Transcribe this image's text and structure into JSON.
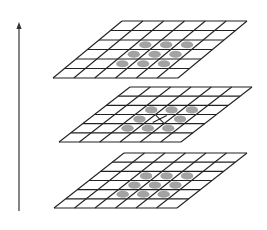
{
  "diagram": {
    "colors": {
      "line": "#222222",
      "dot": "#a3a3a3",
      "background": "#ffffff",
      "arrow": "#333333"
    },
    "grid": {
      "rows": 6,
      "cols": 6
    },
    "arrow": {
      "x": 19,
      "y_start": 211,
      "y_end": 22,
      "direction": "up"
    },
    "layers": [
      {
        "name": "top-layer",
        "corners": {
          "tl": [
            122,
            21
          ],
          "tr": [
            247,
            21
          ],
          "bl": [
            53,
            78
          ],
          "br": [
            177,
            78
          ]
        },
        "dots": [
          [
            2,
            2
          ],
          [
            2,
            3
          ],
          [
            2,
            4
          ],
          [
            3,
            2
          ],
          [
            3,
            3
          ],
          [
            3,
            4
          ],
          [
            4,
            2
          ],
          [
            4,
            3
          ],
          [
            4,
            4
          ]
        ],
        "mark": null
      },
      {
        "name": "middle-layer",
        "corners": {
          "tl": [
            130,
            87
          ],
          "tr": [
            252,
            87
          ],
          "bl": [
            59,
            142
          ],
          "br": [
            182,
            142
          ]
        },
        "dots": [
          [
            2,
            2
          ],
          [
            2,
            3
          ],
          [
            2,
            4
          ],
          [
            3,
            2
          ],
          [
            3,
            4
          ],
          [
            4,
            2
          ],
          [
            4,
            3
          ],
          [
            4,
            4
          ]
        ],
        "mark": {
          "type": "x",
          "cell": [
            3,
            3
          ]
        }
      },
      {
        "name": "bottom-layer",
        "corners": {
          "tl": [
            124,
            153
          ],
          "tr": [
            247,
            153
          ],
          "bl": [
            54,
            208
          ],
          "br": [
            177,
            208
          ]
        },
        "dots": [
          [
            2,
            2
          ],
          [
            2,
            3
          ],
          [
            2,
            4
          ],
          [
            3,
            2
          ],
          [
            3,
            3
          ],
          [
            3,
            4
          ],
          [
            4,
            2
          ],
          [
            4,
            3
          ],
          [
            4,
            4
          ]
        ],
        "mark": null
      }
    ]
  }
}
